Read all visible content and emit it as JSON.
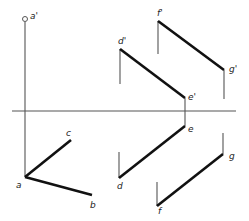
{
  "diagram": {
    "type": "orthographic-projection",
    "axis": {
      "x1": 12,
      "y1": 111,
      "x2": 236,
      "y2": 111
    },
    "points": {
      "a_prime": {
        "label": "a'",
        "x": 25,
        "y": 19,
        "lx": 30,
        "ly": 19
      },
      "a": {
        "label": "a",
        "x": 25,
        "y": 177,
        "lx": 16,
        "ly": 188
      },
      "b": {
        "label": "b",
        "x": 92,
        "y": 195,
        "lx": 90,
        "ly": 208
      },
      "c": {
        "label": "c",
        "x": 71,
        "y": 140,
        "lx": 66,
        "ly": 136
      },
      "d_prime": {
        "label": "d'",
        "x": 120,
        "y": 49,
        "lx": 118,
        "ly": 44
      },
      "e_prime": {
        "label": "e'",
        "x": 185,
        "y": 98,
        "lx": 188,
        "ly": 100
      },
      "f_prime": {
        "label": "f'",
        "x": 158,
        "y": 21,
        "lx": 157,
        "ly": 16
      },
      "g_prime": {
        "label": "g'",
        "x": 224,
        "y": 70,
        "lx": 229,
        "ly": 72
      },
      "d": {
        "label": "d",
        "x": 119,
        "y": 178,
        "lx": 117,
        "ly": 189
      },
      "e": {
        "label": "e",
        "x": 185,
        "y": 126,
        "lx": 188,
        "ly": 132
      },
      "f": {
        "label": "f",
        "x": 157,
        "y": 206,
        "lx": 158,
        "ly": 214
      },
      "g": {
        "label": "g",
        "x": 223,
        "y": 154,
        "lx": 229,
        "ly": 159
      }
    },
    "thin_lines": [
      {
        "name": "a-projector",
        "x1": 25,
        "y1": 22,
        "x2": 25,
        "y2": 177
      },
      {
        "name": "d-prime-projector",
        "x1": 120,
        "y1": 49,
        "x2": 120,
        "y2": 84
      },
      {
        "name": "f-prime-projector",
        "x1": 158,
        "y1": 21,
        "x2": 158,
        "y2": 54
      },
      {
        "name": "g-prime-projector",
        "x1": 224,
        "y1": 70,
        "x2": 224,
        "y2": 99
      },
      {
        "name": "e-projector",
        "x1": 185,
        "y1": 98,
        "x2": 185,
        "y2": 126
      },
      {
        "name": "d-projector",
        "x1": 119,
        "y1": 152,
        "x2": 119,
        "y2": 178
      },
      {
        "name": "f-projector",
        "x1": 157,
        "y1": 182,
        "x2": 157,
        "y2": 206
      },
      {
        "name": "g-projector",
        "x1": 223,
        "y1": 133,
        "x2": 223,
        "y2": 154
      }
    ],
    "thick_lines": [
      {
        "name": "line-ab",
        "x1": 25,
        "y1": 177,
        "x2": 92,
        "y2": 195
      },
      {
        "name": "line-ac",
        "x1": 25,
        "y1": 177,
        "x2": 71,
        "y2": 140
      },
      {
        "name": "line-d-prime-e-prime",
        "x1": 120,
        "y1": 49,
        "x2": 185,
        "y2": 98
      },
      {
        "name": "line-f-prime-g-prime",
        "x1": 158,
        "y1": 21,
        "x2": 224,
        "y2": 70
      },
      {
        "name": "line-de",
        "x1": 119,
        "y1": 178,
        "x2": 185,
        "y2": 126
      },
      {
        "name": "line-fg",
        "x1": 157,
        "y1": 206,
        "x2": 223,
        "y2": 154
      }
    ],
    "circle": {
      "name": "a-prime-point",
      "cx": 25,
      "cy": 19,
      "r": 2.5
    }
  }
}
